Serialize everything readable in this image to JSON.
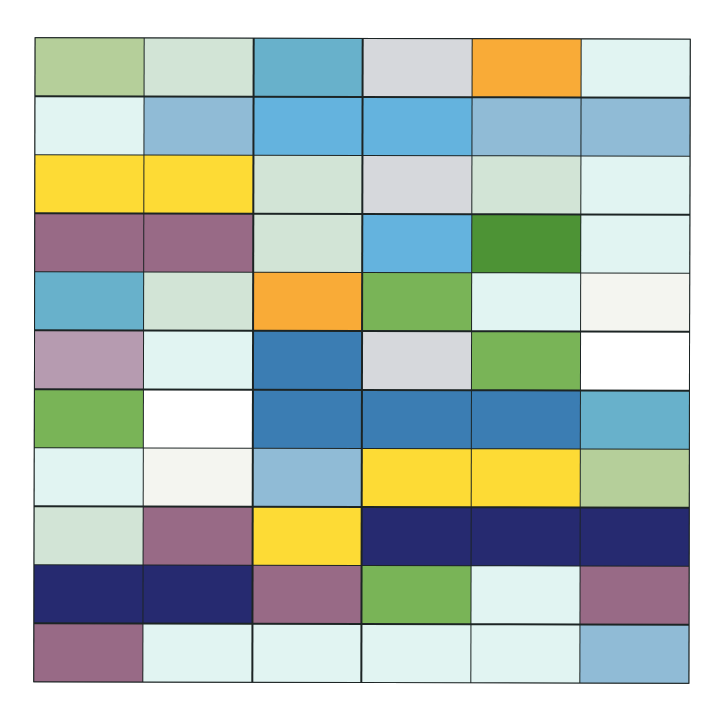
{
  "palette": {
    "light_green": "#b5cf9a",
    "pale_mint": "#d2e4d6",
    "teal_blue": "#68b1cb",
    "light_gray": "#d6d8dc",
    "orange": "#f9ab37",
    "ice": "#e1f4f2",
    "steel_light": "#90bbd6",
    "sky_blue": "#64b3de",
    "yellow": "#fddb35",
    "mauve": "#986a86",
    "dark_green": "#4d9335",
    "green": "#79b457",
    "off_white": "#f4f5f0",
    "light_mauve": "#b69bb0",
    "blue": "#3b7db3",
    "white": "#ffffff",
    "navy": "#262a70"
  },
  "grid": {
    "columns": 6,
    "rows": [
      [
        "light_green",
        "pale_mint",
        "teal_blue",
        "light_gray",
        "orange",
        "ice"
      ],
      [
        "ice",
        "steel_light",
        "sky_blue",
        "sky_blue",
        "steel_light",
        "steel_light"
      ],
      [
        "yellow",
        "yellow",
        "pale_mint",
        "light_gray",
        "pale_mint",
        "ice"
      ],
      [
        "mauve",
        "mauve",
        "pale_mint",
        "sky_blue",
        "dark_green",
        "ice"
      ],
      [
        "teal_blue",
        "pale_mint",
        "orange",
        "green",
        "ice",
        "off_white"
      ],
      [
        "light_mauve",
        "ice",
        "blue",
        "light_gray",
        "green",
        "white"
      ],
      [
        "green",
        "white",
        "blue",
        "blue",
        "blue",
        "teal_blue"
      ],
      [
        "ice",
        "off_white",
        "steel_light",
        "yellow",
        "yellow",
        "light_green"
      ],
      [
        "pale_mint",
        "mauve",
        "yellow",
        "navy",
        "navy",
        "navy"
      ],
      [
        "navy",
        "navy",
        "mauve",
        "green",
        "ice",
        "mauve"
      ],
      [
        "mauve",
        "ice",
        "ice",
        "ice",
        "ice",
        "steel_light"
      ]
    ]
  }
}
